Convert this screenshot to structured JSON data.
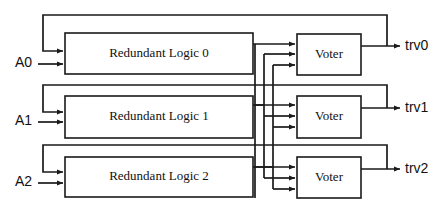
{
  "diagram": {
    "stroke_color": "#1a1a1a",
    "background_color": "#ffffff",
    "logic_blocks": [
      {
        "label": "Redundant Logic 0"
      },
      {
        "label": "Redundant Logic 1"
      },
      {
        "label": "Redundant Logic 2"
      }
    ],
    "voter_blocks": [
      {
        "label": "Voter"
      },
      {
        "label": "Voter"
      },
      {
        "label": "Voter"
      }
    ],
    "inputs": [
      {
        "label": "A0"
      },
      {
        "label": "A1"
      },
      {
        "label": "A2"
      }
    ],
    "outputs": [
      {
        "label": "trv0"
      },
      {
        "label": "trv1"
      },
      {
        "label": "trv2"
      }
    ]
  }
}
